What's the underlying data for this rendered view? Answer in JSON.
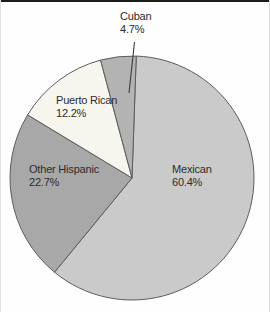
{
  "chart_data": {
    "type": "pie",
    "title": "",
    "categories": [
      "Mexican",
      "Other Hispanic",
      "Puerto Rican",
      "Cuban"
    ],
    "values": [
      60.4,
      22.7,
      12.2,
      4.7
    ],
    "slices": [
      {
        "label": "Mexican",
        "value": 60.4,
        "pct_label": "60.4%",
        "color": "#cacaca"
      },
      {
        "label": "Other Hispanic",
        "value": 22.7,
        "pct_label": "22.7%",
        "color": "#a8a8a8"
      },
      {
        "label": "Puerto Rican",
        "value": 12.2,
        "pct_label": "12.2%",
        "color": "#f6f5ee"
      },
      {
        "label": "Cuban",
        "value": 4.7,
        "pct_label": "4.7%",
        "color": "#b3b3b3"
      }
    ],
    "start_angle_deg": 2,
    "direction": "clockwise",
    "geometry": {
      "cx": 131,
      "cy": 178,
      "r": 122
    },
    "stroke_color": "#5c5c5c",
    "leader_line_color": "#3a3a3a",
    "legend_position": "none",
    "labels_on_slices": true
  }
}
